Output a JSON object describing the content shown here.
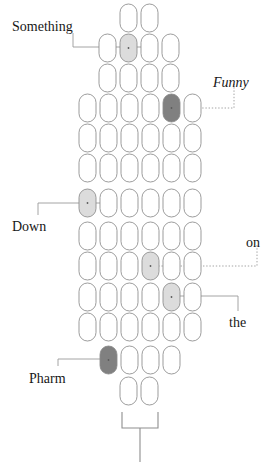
{
  "figure": {
    "title_words": [
      "Something",
      "Funny",
      "Down",
      "on",
      "the",
      "Pharm"
    ],
    "caption": "Pill-capsule cluster diagram with annotated capsules and bottom bracket",
    "colors": {
      "background": "#ffffff",
      "capsule_stroke": "#8a8a8a",
      "capsule_empty_fill": "#ffffff",
      "capsule_light_fill": "#dcdcdc",
      "capsule_dark_fill": "#808080",
      "leader_line": "#9a9a9a",
      "bracket": "#8e8e8e",
      "text": "#171717"
    },
    "capsule": {
      "width": 17,
      "height": 28,
      "radius": 8.5,
      "col_pitch": 21,
      "row_pitch": 30
    }
  },
  "labels": [
    {
      "id": "label-something",
      "text": "Something",
      "style": "regular",
      "x": 12,
      "y": 20,
      "anchor_row": 2,
      "anchor_col": 2
    },
    {
      "id": "label-funny",
      "text": "Funny",
      "style": "italic",
      "x": 213,
      "y": 76,
      "anchor_row": 4,
      "anchor_col": 5
    },
    {
      "id": "label-down",
      "text": "Down",
      "style": "regular",
      "x": 12,
      "y": 220,
      "anchor_row": 7,
      "anchor_col": 1
    },
    {
      "id": "label-on",
      "text": "on",
      "style": "regular",
      "x": 246,
      "y": 236,
      "anchor_row": 9,
      "anchor_col": 4
    },
    {
      "id": "label-the",
      "text": "the",
      "style": "regular",
      "x": 229,
      "y": 316,
      "anchor_row": 10,
      "anchor_col": 5
    },
    {
      "id": "label-pharm",
      "text": "Pharm",
      "style": "regular",
      "x": 29,
      "y": 372,
      "anchor_row": 12,
      "anchor_col": 1
    }
  ],
  "rows": [
    {
      "index": 1,
      "count": 2,
      "x": 120,
      "y": 4,
      "fills": [
        "empty",
        "empty"
      ]
    },
    {
      "index": 2,
      "count": 4,
      "x": 99,
      "y": 34,
      "fills": [
        "empty",
        "light",
        "empty",
        "empty"
      ]
    },
    {
      "index": 3,
      "count": 4,
      "x": 99,
      "y": 64,
      "fills": [
        "empty",
        "empty",
        "empty",
        "empty"
      ]
    },
    {
      "index": 4,
      "count": 6,
      "x": 79,
      "y": 94,
      "fills": [
        "empty",
        "empty",
        "empty",
        "empty",
        "dark",
        "empty"
      ]
    },
    {
      "index": 5,
      "count": 6,
      "x": 79,
      "y": 124,
      "fills": [
        "empty",
        "empty",
        "empty",
        "empty",
        "empty",
        "empty"
      ]
    },
    {
      "index": 6,
      "count": 6,
      "x": 79,
      "y": 154,
      "fills": [
        "empty",
        "empty",
        "empty",
        "empty",
        "empty",
        "empty"
      ]
    },
    {
      "index": 7,
      "count": 6,
      "x": 79,
      "y": 189,
      "fills": [
        "light",
        "empty",
        "empty",
        "empty",
        "empty",
        "empty"
      ]
    },
    {
      "index": 8,
      "count": 6,
      "x": 79,
      "y": 222,
      "fills": [
        "empty",
        "empty",
        "empty",
        "empty",
        "empty",
        "empty"
      ]
    },
    {
      "index": 9,
      "count": 6,
      "x": 79,
      "y": 252,
      "fills": [
        "empty",
        "empty",
        "empty",
        "light",
        "empty",
        "empty"
      ]
    },
    {
      "index": 10,
      "count": 6,
      "x": 79,
      "y": 283,
      "fills": [
        "empty",
        "empty",
        "empty",
        "empty",
        "light",
        "empty"
      ]
    },
    {
      "index": 11,
      "count": 6,
      "x": 79,
      "y": 313,
      "fills": [
        "empty",
        "empty",
        "empty",
        "empty",
        "empty",
        "empty"
      ]
    },
    {
      "index": 12,
      "count": 4,
      "x": 100,
      "y": 346,
      "fills": [
        "dark",
        "empty",
        "empty",
        "empty"
      ]
    },
    {
      "index": 13,
      "count": 2,
      "x": 120,
      "y": 377,
      "fills": [
        "empty",
        "empty"
      ]
    }
  ],
  "bracket": {
    "id": "bottom-bracket",
    "left_x": 122,
    "right_x": 158,
    "top_y": 412,
    "bottom_y": 428,
    "stem_x": 140,
    "stem_bottom_y": 462
  },
  "leaders": [
    {
      "id": "leader-something",
      "kind": "solid",
      "points": "73,33 73,47 147,47"
    },
    {
      "id": "leader-funny",
      "kind": "dotted",
      "points": "234,84 234,108 199,108"
    },
    {
      "id": "leader-down",
      "kind": "solid",
      "points": "38,215 38,203 104,203"
    },
    {
      "id": "leader-on",
      "kind": "dotted",
      "points": "257,245 257,266 150,266"
    },
    {
      "id": "leader-the",
      "kind": "solid",
      "points": "238,311 238,296 171,296"
    },
    {
      "id": "leader-pharm",
      "kind": "solid",
      "points": "58,366 58,359 108,359"
    }
  ]
}
